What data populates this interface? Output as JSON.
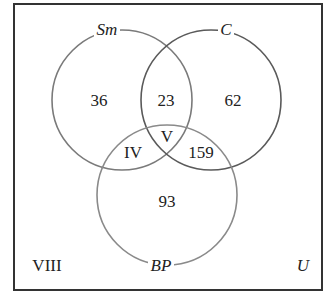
{
  "diagram": {
    "type": "venn-3",
    "universe_label": "U",
    "outside_label": "VIII",
    "sets": [
      {
        "name": "Sm",
        "cx": 122,
        "cy": 100,
        "r": 70,
        "stroke": "#7a7a7a"
      },
      {
        "name": "C",
        "cx": 211,
        "cy": 100,
        "r": 70,
        "stroke": "#5a5a5a"
      },
      {
        "name": "BP",
        "cx": 167,
        "cy": 195,
        "r": 70,
        "stroke": "#8a8a8a"
      }
    ],
    "regions": {
      "sm_only": "36",
      "sm_c_only": "23",
      "c_only": "62",
      "sm_bp_only": "IV",
      "all_three": "V",
      "c_bp_only": "159",
      "bp_only": "93"
    },
    "colors": {
      "frame": "#333333",
      "text": "#222222"
    }
  }
}
